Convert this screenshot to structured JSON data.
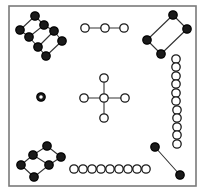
{
  "canvas": {
    "width": 208,
    "height": 196,
    "background": "#ffffff"
  },
  "frame": {
    "name": "plot-border",
    "x": 9,
    "y": 6,
    "width": 187,
    "height": 180,
    "stroke": "#7a7a7a",
    "stroke_width": 1.6,
    "fill": "#ffffff"
  },
  "style": {
    "filled_node_fill": "#1a1a1a",
    "filled_node_stroke": "#000000",
    "open_node_fill": "#ffffff",
    "open_node_stroke": "#1a1a1a",
    "node_radius": 4.2,
    "node_stroke_width": 1.3,
    "edge_stroke": "#333333",
    "edge_width": 1.1
  },
  "chart_data": {
    "type": "scatter",
    "title": "",
    "xlabel": "",
    "ylabel": "",
    "xlim": [
      0,
      208
    ],
    "ylim": [
      0,
      196
    ],
    "grid": false,
    "legend": null,
    "components": [
      {
        "id": "top-left-ladder",
        "node_style": "filled",
        "node_count": 8,
        "nodes": [
          {
            "id": "tl1",
            "x": 35,
            "y": 16
          },
          {
            "id": "tl2",
            "x": 44,
            "y": 25
          },
          {
            "id": "tl3",
            "x": 20,
            "y": 30
          },
          {
            "id": "tl4",
            "x": 54,
            "y": 31
          },
          {
            "id": "tl5",
            "x": 29,
            "y": 37
          },
          {
            "id": "tl6",
            "x": 62,
            "y": 41
          },
          {
            "id": "tl7",
            "x": 38,
            "y": 47
          },
          {
            "id": "tl8",
            "x": 46,
            "y": 56
          }
        ],
        "edges": [
          [
            "tl1",
            "tl2"
          ],
          [
            "tl2",
            "tl4"
          ],
          [
            "tl4",
            "tl6"
          ],
          [
            "tl1",
            "tl3"
          ],
          [
            "tl3",
            "tl5"
          ],
          [
            "tl5",
            "tl7"
          ],
          [
            "tl7",
            "tl8"
          ],
          [
            "tl8",
            "tl6"
          ],
          [
            "tl2",
            "tl5"
          ],
          [
            "tl4",
            "tl7"
          ]
        ]
      },
      {
        "id": "top-middle-chain",
        "node_style": "open",
        "node_count": 3,
        "nodes": [
          {
            "id": "tm1",
            "x": 85,
            "y": 28
          },
          {
            "id": "tm2",
            "x": 105,
            "y": 28
          },
          {
            "id": "tm3",
            "x": 124,
            "y": 28
          }
        ],
        "edges": [
          [
            "tm1",
            "tm2"
          ],
          [
            "tm2",
            "tm3"
          ]
        ]
      },
      {
        "id": "top-right-quad",
        "node_style": "filled",
        "node_count": 4,
        "nodes": [
          {
            "id": "tr1",
            "x": 173,
            "y": 15
          },
          {
            "id": "tr2",
            "x": 187,
            "y": 29
          },
          {
            "id": "tr3",
            "x": 147,
            "y": 40
          },
          {
            "id": "tr4",
            "x": 161,
            "y": 54
          }
        ],
        "edges": [
          [
            "tr1",
            "tr2"
          ],
          [
            "tr2",
            "tr4"
          ],
          [
            "tr4",
            "tr3"
          ],
          [
            "tr3",
            "tr1"
          ]
        ]
      },
      {
        "id": "right-column-chain",
        "node_style": "open",
        "node_count": 11,
        "nodes": [
          {
            "id": "rc1",
            "x": 176,
            "y": 59
          },
          {
            "id": "rc2",
            "x": 176,
            "y": 67
          },
          {
            "id": "rc3",
            "x": 176,
            "y": 76
          },
          {
            "id": "rc4",
            "x": 176,
            "y": 84
          },
          {
            "id": "rc5",
            "x": 176,
            "y": 93
          },
          {
            "id": "rc6",
            "x": 176,
            "y": 101
          },
          {
            "id": "rc7",
            "x": 177,
            "y": 110
          },
          {
            "id": "rc8",
            "x": 177,
            "y": 118
          },
          {
            "id": "rc9",
            "x": 177,
            "y": 127
          },
          {
            "id": "rc10",
            "x": 177,
            "y": 135
          },
          {
            "id": "rc11",
            "x": 177,
            "y": 144
          }
        ],
        "edges": [
          [
            "rc1",
            "rc2"
          ],
          [
            "rc2",
            "rc3"
          ],
          [
            "rc3",
            "rc4"
          ],
          [
            "rc4",
            "rc5"
          ],
          [
            "rc5",
            "rc6"
          ],
          [
            "rc6",
            "rc7"
          ],
          [
            "rc7",
            "rc8"
          ],
          [
            "rc8",
            "rc9"
          ],
          [
            "rc9",
            "rc10"
          ],
          [
            "rc10",
            "rc11"
          ]
        ]
      },
      {
        "id": "center-cross",
        "node_style": "open",
        "node_count": 5,
        "nodes": [
          {
            "id": "cc_center",
            "x": 104,
            "y": 98
          },
          {
            "id": "cc_top",
            "x": 104,
            "y": 78
          },
          {
            "id": "cc_bottom",
            "x": 104,
            "y": 118
          },
          {
            "id": "cc_left",
            "x": 84,
            "y": 98
          },
          {
            "id": "cc_right",
            "x": 125,
            "y": 98
          }
        ],
        "edges": [
          [
            "cc_center",
            "cc_top"
          ],
          [
            "cc_center",
            "cc_bottom"
          ],
          [
            "cc_center",
            "cc_left"
          ],
          [
            "cc_center",
            "cc_right"
          ]
        ]
      },
      {
        "id": "isolated-ring-node",
        "node_style": "ring",
        "node_count": 1,
        "nodes": [
          {
            "id": "iso1",
            "x": 41,
            "y": 97
          }
        ],
        "edges": []
      },
      {
        "id": "bottom-left-quad",
        "node_style": "filled",
        "node_count": 6,
        "nodes": [
          {
            "id": "bl1",
            "x": 47,
            "y": 146
          },
          {
            "id": "bl2",
            "x": 33,
            "y": 155
          },
          {
            "id": "bl3",
            "x": 61,
            "y": 157
          },
          {
            "id": "bl4",
            "x": 21,
            "y": 165
          },
          {
            "id": "bl5",
            "x": 49,
            "y": 165
          },
          {
            "id": "bl6",
            "x": 34,
            "y": 177
          }
        ],
        "edges": [
          [
            "bl1",
            "bl2"
          ],
          [
            "bl1",
            "bl3"
          ],
          [
            "bl3",
            "bl5"
          ],
          [
            "bl2",
            "bl4"
          ],
          [
            "bl4",
            "bl6"
          ],
          [
            "bl6",
            "bl5"
          ],
          [
            "bl2",
            "bl5"
          ]
        ]
      },
      {
        "id": "bottom-middle-chain",
        "node_style": "open",
        "node_count": 9,
        "nodes": [
          {
            "id": "bm1",
            "x": 74,
            "y": 169
          },
          {
            "id": "bm2",
            "x": 83,
            "y": 169
          },
          {
            "id": "bm3",
            "x": 92,
            "y": 169
          },
          {
            "id": "bm4",
            "x": 101,
            "y": 169
          },
          {
            "id": "bm5",
            "x": 110,
            "y": 169
          },
          {
            "id": "bm6",
            "x": 119,
            "y": 169
          },
          {
            "id": "bm7",
            "x": 128,
            "y": 169
          },
          {
            "id": "bm8",
            "x": 137,
            "y": 169
          },
          {
            "id": "bm9",
            "x": 146,
            "y": 169
          }
        ],
        "edges": [
          [
            "bm1",
            "bm2"
          ],
          [
            "bm2",
            "bm3"
          ],
          [
            "bm3",
            "bm4"
          ],
          [
            "bm4",
            "bm5"
          ],
          [
            "bm5",
            "bm6"
          ],
          [
            "bm6",
            "bm7"
          ],
          [
            "bm7",
            "bm8"
          ],
          [
            "bm8",
            "bm9"
          ]
        ]
      },
      {
        "id": "bottom-right-pair",
        "node_style": "filled",
        "node_count": 2,
        "nodes": [
          {
            "id": "br1",
            "x": 155,
            "y": 147
          },
          {
            "id": "br2",
            "x": 180,
            "y": 175
          }
        ],
        "edges": [
          [
            "br1",
            "br2"
          ]
        ]
      }
    ],
    "totals": {
      "components": 9,
      "nodes": 49,
      "filled_nodes": 21,
      "open_nodes": 28
    }
  }
}
